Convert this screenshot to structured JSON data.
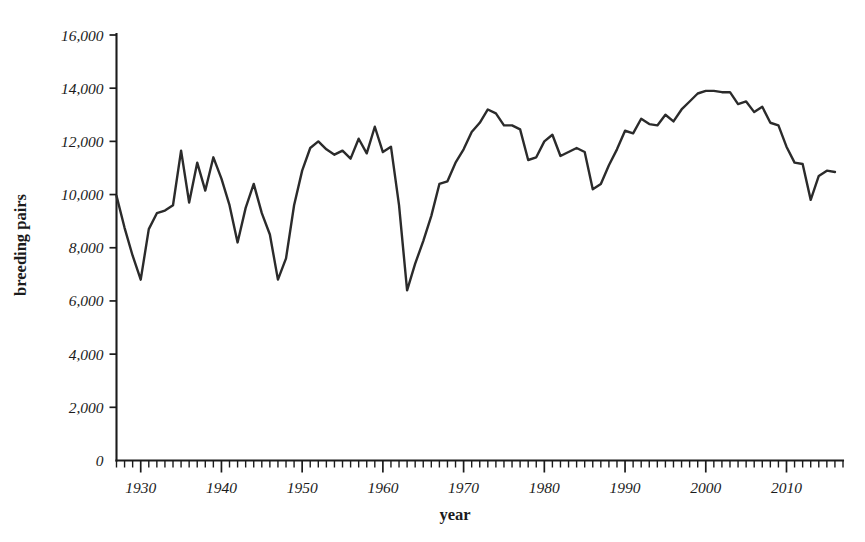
{
  "chart_data": {
    "type": "line",
    "title": "",
    "xlabel": "year",
    "ylabel": "breeding pairs",
    "xlim": [
      1927,
      2017
    ],
    "ylim": [
      0,
      16000
    ],
    "grid": false,
    "legend": null,
    "series_name": "breeding pairs",
    "line_color": "#2b2b2b",
    "y_ticks": [
      0,
      2000,
      4000,
      6000,
      8000,
      10000,
      12000,
      14000,
      16000
    ],
    "y_tick_labels": [
      "0",
      "2,000",
      "4,000",
      "6,000",
      "8,000",
      "10,000",
      "12,000",
      "14,000",
      "16,000"
    ],
    "x_ticks": [
      1930,
      1940,
      1950,
      1960,
      1970,
      1980,
      1990,
      2000,
      2010
    ],
    "x_tick_labels": [
      "1930",
      "1940",
      "1950",
      "1960",
      "1970",
      "1980",
      "1990",
      "2000",
      "2010"
    ],
    "x_minor_tick_step": 1,
    "x": [
      1927,
      1928,
      1929,
      1930,
      1931,
      1932,
      1933,
      1934,
      1935,
      1936,
      1937,
      1938,
      1939,
      1940,
      1941,
      1942,
      1943,
      1944,
      1945,
      1946,
      1947,
      1948,
      1949,
      1950,
      1951,
      1952,
      1953,
      1954,
      1955,
      1956,
      1957,
      1958,
      1959,
      1960,
      1961,
      1962,
      1963,
      1964,
      1965,
      1966,
      1967,
      1968,
      1969,
      1970,
      1971,
      1972,
      1973,
      1974,
      1975,
      1976,
      1977,
      1978,
      1979,
      1980,
      1981,
      1982,
      1983,
      1984,
      1985,
      1986,
      1987,
      1988,
      1989,
      1990,
      1991,
      1992,
      1993,
      1994,
      1995,
      1996,
      1997,
      1998,
      1999,
      2000,
      2001,
      2002,
      2003,
      2004,
      2005,
      2006,
      2007,
      2008,
      2009,
      2010,
      2011,
      2012,
      2013,
      2014,
      2015,
      2016
    ],
    "values": [
      9950,
      8750,
      7700,
      6800,
      8700,
      9300,
      9400,
      9600,
      11650,
      9700,
      11200,
      10150,
      11400,
      10600,
      9600,
      8200,
      9500,
      10400,
      9300,
      8500,
      6800,
      7600,
      9600,
      10900,
      11750,
      12000,
      11700,
      11500,
      11650,
      11350,
      12100,
      11550,
      12550,
      11600,
      11800,
      9600,
      6400,
      7400,
      8250,
      9200,
      10400,
      10500,
      11200,
      11700,
      12350,
      12700,
      13200,
      13050,
      12600,
      12600,
      12450,
      11300,
      11400,
      12000,
      12250,
      11450,
      11600,
      11750,
      11600,
      10200,
      10400,
      11100,
      11700,
      12400,
      12300,
      12850,
      12650,
      12600,
      13000,
      12750,
      13200,
      13500,
      13800,
      13900,
      13900,
      13850,
      13850,
      13400,
      13500,
      13100,
      13300,
      12700,
      12600,
      11800,
      11200,
      11150,
      9800,
      10700,
      10900,
      10850
    ]
  }
}
